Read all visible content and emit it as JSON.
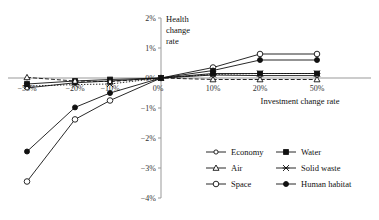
{
  "chart_data": {
    "type": "line",
    "title": "",
    "xlabel": "Investment change rate",
    "ylabel": "Health change rate",
    "ylabel_lines": [
      "Health",
      "change",
      "rate"
    ],
    "categories": [
      "-50%",
      "-20%",
      "-10%",
      "0%",
      "10%",
      "20%",
      "50%"
    ],
    "x_tick_labels": [
      "−50%",
      "−20%",
      "−10%",
      "0%",
      "10%",
      "20%",
      "50%"
    ],
    "y_tick_labels": [
      "2%",
      "1%",
      "0%",
      "−1%",
      "−2%",
      "−3%",
      "−4%"
    ],
    "y_tick_values": [
      2,
      1,
      0,
      -1,
      -2,
      -3,
      -4
    ],
    "ylim": [
      -4,
      2
    ],
    "grid": false,
    "legend_position": "bottom-right",
    "series": [
      {
        "name": "Economy",
        "marker": "open-circle-small",
        "dash": "solid",
        "values": [
          -0.33,
          -0.16,
          -0.1,
          0,
          0.1,
          0.08,
          0.08
        ]
      },
      {
        "name": "Water",
        "marker": "filled-square",
        "dash": "solid",
        "values": [
          -0.2,
          -0.1,
          -0.05,
          0,
          0.15,
          0.15,
          0.15
        ]
      },
      {
        "name": "Air",
        "marker": "open-triangle",
        "dash": "dashed",
        "values": [
          0.02,
          -0.1,
          -0.12,
          0,
          -0.05,
          -0.05,
          -0.05
        ]
      },
      {
        "name": "Solid waste",
        "marker": "x-cross",
        "dash": "dotted",
        "values": [
          -0.27,
          -0.22,
          -0.2,
          0,
          0.12,
          0.15,
          0.15
        ]
      },
      {
        "name": "Space",
        "marker": "open-circle",
        "dash": "solid",
        "values": [
          -3.45,
          -1.38,
          -0.75,
          0,
          0.35,
          0.8,
          0.8
        ]
      },
      {
        "name": "Human habitat",
        "marker": "filled-circle",
        "dash": "solid",
        "values": [
          -2.45,
          -0.98,
          -0.5,
          0,
          0.25,
          0.6,
          0.6
        ]
      }
    ],
    "legend": [
      {
        "label": "Economy",
        "marker": "open-circle-small"
      },
      {
        "label": "Water",
        "marker": "filled-square"
      },
      {
        "label": "Air",
        "marker": "open-triangle"
      },
      {
        "label": "Solid waste",
        "marker": "x-cross"
      },
      {
        "label": "Space",
        "marker": "open-circle"
      },
      {
        "label": "Human habitat",
        "marker": "filled-circle"
      }
    ],
    "colors": {
      "line": "#111111",
      "axis": "#999999",
      "text": "#111111",
      "background": "#ffffff"
    }
  }
}
